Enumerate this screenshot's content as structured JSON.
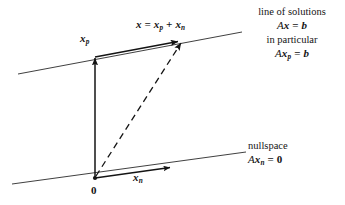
{
  "figure": {
    "type": "math-diagram",
    "background_color": "#ffffff",
    "ink_color": "#141414"
  },
  "diagram": {
    "lines": [
      {
        "name": "line-of-solutions",
        "label": "line of solutions",
        "from": [
          18,
          74
        ],
        "to": [
          242,
          32
        ],
        "style": "solid"
      },
      {
        "name": "nullspace-line",
        "label": "nullspace",
        "from": [
          12,
          184
        ],
        "to": [
          246,
          152
        ],
        "style": "solid"
      }
    ],
    "points": [
      {
        "name": "origin",
        "label": "0",
        "at": [
          95,
          178
        ]
      }
    ],
    "vectors": [
      {
        "name": "xp-vector",
        "label": "x_p",
        "from": [
          95,
          178
        ],
        "to": [
          95,
          57
        ],
        "style": "solid",
        "arrowhead": true
      },
      {
        "name": "xn-shifted-vector",
        "label": "",
        "from": [
          95,
          57
        ],
        "to": [
          180,
          41
        ],
        "style": "solid",
        "arrowhead": true
      },
      {
        "name": "x-total-vector",
        "label": "x = x_p + x_n",
        "from": [
          96,
          177
        ],
        "to": [
          183,
          42
        ],
        "style": "dashed",
        "arrowhead": true
      },
      {
        "name": "xn-vector",
        "label": "x_n",
        "from": [
          95,
          178
        ],
        "to": [
          172,
          167
        ],
        "style": "solid",
        "arrowhead": true
      }
    ]
  },
  "labels": {
    "xp": {
      "base": "x",
      "sub": "p"
    },
    "xn": {
      "base": "x",
      "sub": "n"
    },
    "origin": "0",
    "sum": {
      "lhs": "x",
      "equals": "=",
      "term1_base": "x",
      "term1_sub": "p",
      "plus": "+",
      "term2_base": "x",
      "term2_sub": "n"
    }
  },
  "annotations": {
    "solutions": {
      "name": "line-of-solutions-annotation",
      "line1": "line of solutions",
      "line2": {
        "matrix": "A",
        "vec": "x",
        "equals": "=",
        "rhs": "b"
      },
      "line3": "in particular",
      "line4": {
        "matrix": "A",
        "vec": "x",
        "sub": "p",
        "equals": "=",
        "rhs": "b"
      }
    },
    "nullspace": {
      "name": "nullspace-annotation",
      "line1": "nullspace",
      "line2": {
        "matrix": "A",
        "vec": "x",
        "sub": "n",
        "equals": "=",
        "rhs": "0"
      }
    }
  }
}
